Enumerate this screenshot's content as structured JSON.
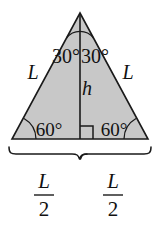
{
  "figure": {
    "shape": "equilateral-triangle",
    "fill_color": "#c8c8c8",
    "stroke_color": "#1a1a1a",
    "background_color": "#ffffff"
  },
  "labels": {
    "side_left": "L",
    "side_right": "L",
    "altitude": "h",
    "apex_angle_left": "30°",
    "apex_angle_right": "30°",
    "base_angle_left": "60°",
    "base_angle_right": "60°",
    "half_base_left_numerator": "L",
    "half_base_left_denominator": "2",
    "half_base_right_numerator": "L",
    "half_base_right_denominator": "2"
  },
  "markers": {
    "right_angle": "right-angle-square",
    "apex_arc": "angle-arc",
    "base_left_arc": "angle-arc",
    "base_right_arc": "angle-arc",
    "brace_left": "curly-brace",
    "brace_right": "curly-brace"
  },
  "geometry": {
    "apex_x": 80,
    "apex_y": 13,
    "base_left_x": 12,
    "base_right_x": 148,
    "base_y": 139,
    "altitude_x": 80
  }
}
